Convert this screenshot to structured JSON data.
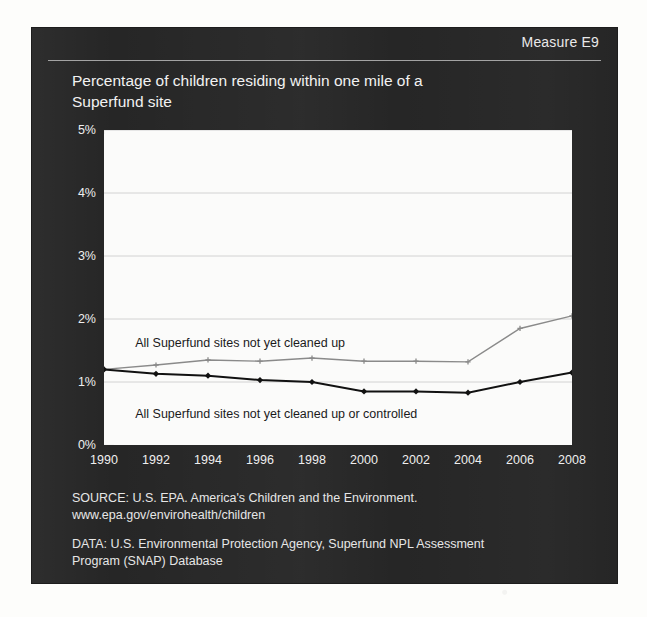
{
  "header": {
    "measure_label": "Measure E9"
  },
  "chart_title_line1": "Percentage of children residing within one mile of a",
  "chart_title_line2": "Superfund site",
  "footnotes": {
    "source_line1": "SOURCE: U.S. EPA. America's Children and the Environment.",
    "source_line2": "www.epa.gov/envirohealth/children",
    "data_line1": "DATA: U.S. Environmental Protection Agency, Superfund NPL Assessment",
    "data_line2": "Program (SNAP) Database"
  },
  "colors": {
    "panel": "#262626",
    "plot_background": "#fbfbfa",
    "series_upper": "#8a8a8a",
    "series_lower": "#111111",
    "gridline": "#d2d2d2",
    "text_light": "#efefef"
  },
  "chart_data": {
    "type": "line",
    "title": "Percentage of children residing within one mile of a Superfund site",
    "xlabel": "",
    "ylabel": "",
    "x": [
      1990,
      1992,
      1994,
      1996,
      1998,
      2000,
      2002,
      2004,
      2006,
      2008
    ],
    "xtick_labels": [
      "1990",
      "1992",
      "1994",
      "1996",
      "1998",
      "2000",
      "2002",
      "2004",
      "2006",
      "2008"
    ],
    "ytick_labels": [
      "0%",
      "1%",
      "2%",
      "3%",
      "4%",
      "5%"
    ],
    "yticks": [
      0,
      1,
      2,
      3,
      4,
      5
    ],
    "ylim": [
      0,
      5
    ],
    "xlim": [
      1990,
      2008
    ],
    "grid": true,
    "legend": "inline-annotations",
    "series": [
      {
        "name": "All Superfund sites not yet cleaned up",
        "color": "#8a8a8a",
        "marker": "cross",
        "values": [
          1.2,
          1.27,
          1.35,
          1.33,
          1.38,
          1.33,
          1.33,
          1.32,
          1.85,
          2.05
        ]
      },
      {
        "name": "All Superfund sites not yet cleaned up or controlled",
        "color": "#111111",
        "marker": "diamond",
        "values": [
          1.2,
          1.13,
          1.1,
          1.03,
          1.0,
          0.85,
          0.85,
          0.83,
          1.0,
          1.15
        ]
      }
    ],
    "annotations": [
      {
        "text": "All Superfund sites not yet cleaned up",
        "x": 1991.2,
        "y": 1.62
      },
      {
        "text": "All Superfund sites not yet cleaned up or controlled",
        "x": 1991.2,
        "y": 0.5
      }
    ]
  }
}
